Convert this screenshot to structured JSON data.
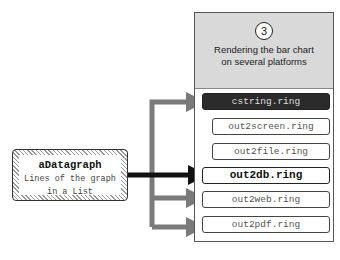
{
  "panel": {
    "step_number": "3",
    "title_line1": "Rendering the bar chart",
    "title_line2": "on several platforms",
    "files": [
      {
        "label": "cstring.ring",
        "style": "dark"
      },
      {
        "label": "out2screen.ring",
        "style": "normal"
      },
      {
        "label": "out2file.ring",
        "style": "normal"
      },
      {
        "label": "out2db.ring",
        "style": "bold"
      },
      {
        "label": "out2web.ring",
        "style": "normal"
      },
      {
        "label": "out2pdf.ring",
        "style": "normal"
      }
    ]
  },
  "source": {
    "title": "aDatagraph",
    "subtitle_line1": "Lines of the graph",
    "subtitle_line2": "in a List"
  },
  "colors": {
    "arrow_gray": "#7a7a7a",
    "arrow_dark": "#111111",
    "header_bg": "#d9d9d9",
    "dark_box": "#2b2b2b"
  }
}
